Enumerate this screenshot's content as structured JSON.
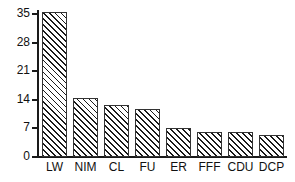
{
  "chart_data": {
    "type": "bar",
    "title": "",
    "subtitle": "",
    "xlabel": "",
    "ylabel": "",
    "categories": [
      "LW",
      "NIM",
      "CL",
      "FU",
      "ER",
      "FFF",
      "CDU",
      "DCP"
    ],
    "values": [
      35.5,
      14.5,
      12.8,
      11.8,
      7.0,
      6.2,
      6.2,
      5.3
    ],
    "ylim": [
      0,
      36
    ],
    "yticks": [
      0,
      7,
      14,
      21,
      28,
      35
    ],
    "ytick_labels": [
      "0",
      "7",
      "14",
      "21",
      "28",
      "35"
    ],
    "grid": false,
    "legend": null,
    "bar_style": {
      "fill": "#ffffff",
      "hatch": "diagonal-45",
      "hatch_color": "#1a1a1a",
      "edge_color": "#333333"
    },
    "axis_color": "#1a1a1a",
    "text_color": "#111111",
    "background": "#ffffff"
  }
}
